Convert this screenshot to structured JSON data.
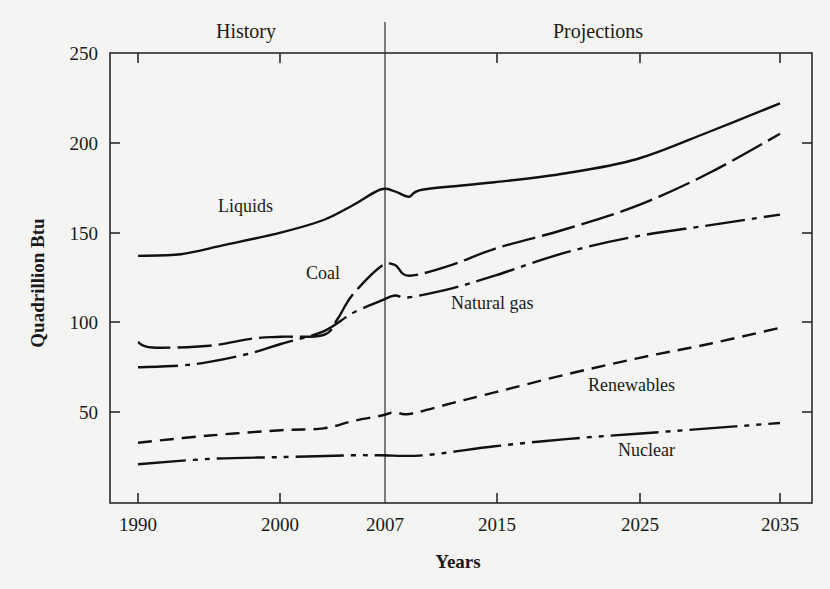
{
  "chart_data": {
    "type": "line",
    "title": "",
    "xlabel": "Years",
    "ylabel": "Quadrillion Btu",
    "ylim": [
      0,
      250
    ],
    "xlim": [
      1990,
      2035
    ],
    "grid": false,
    "legend": "inline labels",
    "yticks": [
      50,
      100,
      150,
      200,
      250
    ],
    "xticks": [
      1990,
      2000,
      2007,
      2015,
      2025,
      2035
    ],
    "divider_year": 2007,
    "regions": [
      {
        "label": "History",
        "from": 1990,
        "to": 2007
      },
      {
        "label": "Projections",
        "from": 2007,
        "to": 2035
      }
    ],
    "series": [
      {
        "name": "Liquids",
        "style": "solid",
        "x": [
          1990,
          1993,
          1996,
          2000,
          2003,
          2005,
          2007,
          2008,
          2009,
          2010,
          2015,
          2020,
          2025,
          2030,
          2035
        ],
        "values": [
          137,
          138,
          143,
          150,
          157,
          165,
          174,
          173,
          170,
          174,
          178,
          183,
          191,
          206,
          222
        ]
      },
      {
        "name": "Coal",
        "style": "long-dash",
        "x": [
          1990,
          1991,
          1995,
          1998,
          2000,
          2003,
          2004,
          2005,
          2007,
          2008,
          2009,
          2012,
          2015,
          2020,
          2025,
          2030,
          2035
        ],
        "values": [
          89,
          86,
          87,
          91,
          92,
          93,
          102,
          115,
          131,
          132,
          126,
          132,
          141,
          152,
          165,
          183,
          205
        ]
      },
      {
        "name": "Natural gas",
        "style": "dash-dot",
        "x": [
          1990,
          1993,
          1995,
          1998,
          2000,
          2003,
          2005,
          2007,
          2008,
          2009,
          2012,
          2015,
          2020,
          2025,
          2030,
          2035
        ],
        "values": [
          75,
          76,
          78,
          83,
          88,
          95,
          105,
          112,
          115,
          114,
          119,
          126,
          139,
          148,
          154,
          160
        ]
      },
      {
        "name": "Renewables",
        "style": "short-dash",
        "x": [
          1990,
          1995,
          2000,
          2003,
          2005,
          2007,
          2008,
          2009,
          2012,
          2015,
          2020,
          2025,
          2030,
          2035
        ],
        "values": [
          33,
          37,
          40,
          41,
          45,
          48,
          50,
          49,
          55,
          61,
          71,
          80,
          88,
          97
        ]
      },
      {
        "name": "Nuclear",
        "style": "dash-dot-dot",
        "x": [
          1990,
          1995,
          2000,
          2005,
          2007,
          2010,
          2015,
          2020,
          2025,
          2030,
          2035
        ],
        "values": [
          21,
          24,
          25,
          26,
          26,
          26,
          31,
          35,
          38,
          41,
          44
        ]
      }
    ]
  },
  "labels": {
    "history": "History",
    "projections": "Projections",
    "ylabel": "Quadrillion Btu",
    "xlabel": "Years",
    "yticks": [
      "50",
      "100",
      "150",
      "200",
      "250"
    ],
    "xticks": [
      "1990",
      "2000",
      "2007",
      "2015",
      "2025",
      "2035"
    ],
    "series": {
      "liquids": "Liquids",
      "coal": "Coal",
      "natural_gas": "Natural gas",
      "renewables": "Renewables",
      "nuclear": "Nuclear"
    }
  }
}
